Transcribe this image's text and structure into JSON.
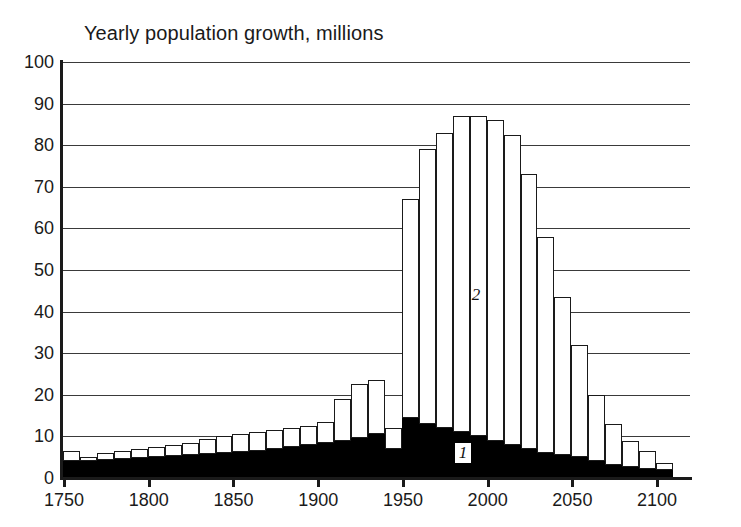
{
  "chart_data": {
    "type": "bar",
    "stacked": true,
    "title": "Yearly population growth, millions",
    "xlabel": "",
    "ylabel": "",
    "ylim": [
      0,
      100
    ],
    "xlim": [
      1750,
      2120
    ],
    "grid": true,
    "legend_position": "inline-annotations",
    "ytick_labels": [
      "0",
      "10",
      "20",
      "30",
      "40",
      "50",
      "60",
      "70",
      "80",
      "90",
      "100"
    ],
    "ytick_values": [
      0,
      10,
      20,
      30,
      40,
      50,
      60,
      70,
      80,
      90,
      100
    ],
    "xtick_labels": [
      "1750",
      "1800",
      "1850",
      "1900",
      "1950",
      "2000",
      "2050",
      "2100"
    ],
    "xtick_values": [
      1750,
      1800,
      1850,
      1900,
      1950,
      2000,
      2050,
      2100
    ],
    "categories": [
      1750,
      1760,
      1770,
      1780,
      1790,
      1800,
      1810,
      1820,
      1830,
      1840,
      1850,
      1860,
      1870,
      1880,
      1890,
      1900,
      1910,
      1920,
      1930,
      1940,
      1950,
      1960,
      1970,
      1980,
      1990,
      2000,
      2010,
      2020,
      2030,
      2040,
      2050,
      2060,
      2070,
      2080,
      2090,
      2100
    ],
    "series": [
      {
        "name": "1",
        "label": "1",
        "color": "#000000",
        "description": "lower black band",
        "values": [
          4.0,
          4.0,
          4.3,
          4.5,
          4.7,
          5.0,
          5.2,
          5.5,
          5.8,
          6.0,
          6.3,
          6.6,
          7.0,
          7.5,
          8.0,
          8.5,
          9.0,
          9.5,
          10.5,
          7.0,
          14.5,
          13.0,
          12.0,
          11.0,
          10.0,
          9.0,
          8.0,
          7.0,
          6.0,
          5.5,
          5.0,
          4.0,
          3.2,
          2.6,
          2.2,
          2.0
        ]
      },
      {
        "name": "2",
        "label": "2",
        "color": "#ffffff",
        "description": "upper white band",
        "values": [
          2.5,
          1.0,
          1.7,
          2.0,
          2.3,
          2.5,
          2.7,
          3.0,
          3.5,
          4.0,
          4.2,
          4.4,
          4.5,
          4.5,
          4.5,
          5.0,
          10.0,
          13.0,
          13.0,
          5.0,
          52.5,
          66.0,
          71.0,
          76.0,
          77.0,
          77.0,
          74.5,
          66.0,
          52.0,
          38.0,
          27.0,
          16.0,
          9.8,
          6.4,
          4.3,
          1.5
        ]
      }
    ],
    "totals": [
      6.5,
      5.0,
      6.0,
      6.5,
      7.0,
      7.5,
      7.9,
      8.5,
      9.3,
      10.0,
      10.5,
      11.0,
      11.5,
      12.0,
      12.5,
      13.5,
      19.0,
      22.5,
      23.5,
      12.0,
      67.0,
      79.0,
      83.0,
      87.0,
      87.0,
      86.0,
      82.5,
      73.0,
      58.0,
      43.5,
      32.0,
      20.0,
      13.0,
      9.0,
      6.5,
      3.5
    ],
    "annotations": [
      {
        "label": "1",
        "x": 1980,
        "y": 6,
        "style": "italic-on-black"
      },
      {
        "label": "2",
        "x": 1990,
        "y": 44,
        "style": "italic-on-white"
      }
    ]
  }
}
